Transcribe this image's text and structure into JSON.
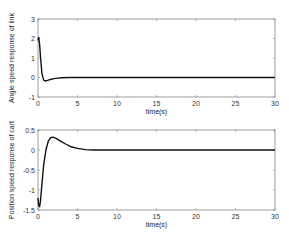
{
  "chart_data": [
    {
      "type": "line",
      "title": "",
      "xlabel": "time(s)",
      "ylabel": "Angle speed response of link",
      "xlim": [
        0,
        30
      ],
      "ylim": [
        -1,
        3
      ],
      "xticks": [
        0,
        5,
        10,
        15,
        20,
        25,
        30
      ],
      "yticks": [
        -1,
        0,
        1,
        2,
        3
      ],
      "grid": false,
      "series": [
        {
          "name": "angle speed",
          "x": [
            0,
            0.1,
            0.2,
            0.35,
            0.5,
            0.7,
            0.9,
            1.2,
            1.6,
            2.0,
            2.5,
            3.0,
            4,
            6,
            10,
            15,
            20,
            25,
            30
          ],
          "y": [
            1.9,
            2.05,
            1.7,
            0.9,
            0.2,
            -0.12,
            -0.18,
            -0.15,
            -0.1,
            -0.06,
            -0.03,
            -0.01,
            0,
            0,
            0,
            0,
            0,
            0,
            0
          ]
        }
      ]
    },
    {
      "type": "line",
      "title": "",
      "xlabel": "time(s)",
      "ylabel": "Position speed response of cart",
      "xlim": [
        0,
        30
      ],
      "ylim": [
        -1.5,
        0.5
      ],
      "xticks": [
        0,
        5,
        10,
        15,
        20,
        25,
        30
      ],
      "yticks": [
        -1.5,
        -1,
        -0.5,
        0,
        0.5
      ],
      "grid": false,
      "series": [
        {
          "name": "cart speed",
          "x": [
            0,
            0.1,
            0.2,
            0.3,
            0.5,
            0.7,
            1.0,
            1.3,
            1.6,
            1.9,
            2.3,
            2.8,
            3.5,
            4.2,
            5.0,
            6.0,
            7.0,
            8,
            10,
            15,
            20,
            25,
            30
          ],
          "y": [
            -1.2,
            -1.4,
            -1.42,
            -1.3,
            -0.85,
            -0.4,
            0.0,
            0.22,
            0.31,
            0.32,
            0.29,
            0.23,
            0.15,
            0.08,
            0.04,
            0.01,
            0,
            0,
            0,
            0,
            0,
            0,
            0
          ]
        }
      ]
    }
  ],
  "labels": {
    "top_ylabel": "Angle speed response of link",
    "top_xlabel": "time(s)",
    "bottom_ylabel": "Position speed response of cart",
    "bottom_xlabel": "time(s)"
  }
}
